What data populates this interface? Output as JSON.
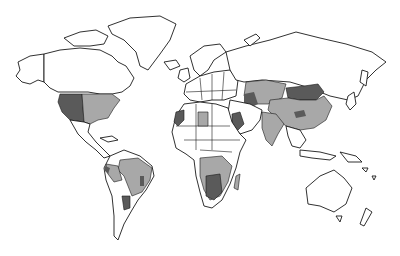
{
  "map": {
    "type": "world-choropleth",
    "style": "grayscale",
    "colors": {
      "background": "#ffffff",
      "outline": "#1a1a1a",
      "category_light": "#a8a8a8",
      "category_dark": "#5a5a5a",
      "no_data": "#ffffff"
    },
    "shaded_regions": [
      {
        "region": "Western United States",
        "shade": "dark"
      },
      {
        "region": "Eastern United States",
        "shade": "light"
      },
      {
        "region": "Brazil",
        "shade": "light"
      },
      {
        "region": "Peru / Andes",
        "shade": "light"
      },
      {
        "region": "Northern Argentina",
        "shade": "dark"
      },
      {
        "region": "Morocco / Western Sahara",
        "shade": "dark"
      },
      {
        "region": "Libya (central)",
        "shade": "light"
      },
      {
        "region": "Southern Africa",
        "shade": "light"
      },
      {
        "region": "Botswana / South Africa",
        "shade": "dark"
      },
      {
        "region": "Madagascar",
        "shade": "light"
      },
      {
        "region": "Central Asia / Kazakhstan",
        "shade": "light"
      },
      {
        "region": "Caspian region",
        "shade": "dark"
      },
      {
        "region": "Mongolia",
        "shade": "dark"
      },
      {
        "region": "China",
        "shade": "light"
      },
      {
        "region": "Arabian Peninsula",
        "shade": "dark"
      },
      {
        "region": "India",
        "shade": "light"
      }
    ]
  }
}
